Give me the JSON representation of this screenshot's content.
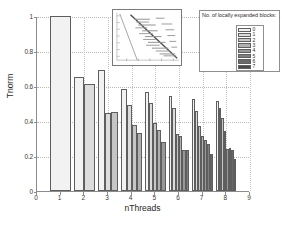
{
  "chart_data": {
    "type": "bar",
    "title": "",
    "xlabel": "nThreads",
    "ylabel": "Tnorm",
    "xlim": [
      0,
      9
    ],
    "ylim": [
      0,
      1
    ],
    "xticks": [
      0,
      1,
      2,
      3,
      4,
      5,
      6,
      7,
      8,
      9
    ],
    "xticklabels": [
      "0",
      "1",
      "2",
      "3",
      "4",
      "5",
      "6",
      "7",
      "8",
      "9"
    ],
    "yticks": [
      0,
      0.2,
      0.4,
      0.6,
      0.8,
      1
    ],
    "yticklabels": [
      "0",
      "0.2",
      "0.4",
      "0.6",
      "0.8",
      "1"
    ],
    "grid": "dotted horizontal and vertical",
    "legend": {
      "title": "No. of locally expanded blocks:",
      "position": "top-right",
      "entries": [
        {
          "label": "0",
          "color": "#f2f2f2"
        },
        {
          "label": "1",
          "color": "#dcdcdc"
        },
        {
          "label": "2",
          "color": "#c6c6c6"
        },
        {
          "label": "3",
          "color": "#b0b0b0"
        },
        {
          "label": "4",
          "color": "#989898"
        },
        {
          "label": "5",
          "color": "#808080"
        },
        {
          "label": "6",
          "color": "#686868"
        },
        {
          "label": "7",
          "color": "#4a4a4a"
        }
      ]
    },
    "categories": [
      "1",
      "2",
      "3",
      "4",
      "5",
      "6",
      "7",
      "8"
    ],
    "series": [
      {
        "name": "0",
        "color": "#f2f2f2",
        "values": [
          1.0,
          0.65,
          0.69,
          0.585,
          0.565,
          0.545,
          0.525,
          0.515
        ]
      },
      {
        "name": "1",
        "color": "#dcdcdc",
        "values": [
          null,
          0.61,
          0.445,
          0.49,
          0.505,
          0.475,
          0.46,
          0.475
        ]
      },
      {
        "name": "2",
        "color": "#c6c6c6",
        "values": [
          null,
          null,
          0.45,
          0.375,
          0.39,
          0.325,
          0.37,
          0.415
        ]
      },
      {
        "name": "3",
        "color": "#b0b0b0",
        "values": [
          null,
          null,
          null,
          0.33,
          0.35,
          0.315,
          0.315,
          0.345
        ]
      },
      {
        "name": "4",
        "color": "#989898",
        "values": [
          null,
          null,
          null,
          null,
          0.28,
          0.235,
          0.29,
          0.24
        ]
      },
      {
        "name": "5",
        "color": "#808080",
        "values": [
          null,
          null,
          null,
          null,
          null,
          0.235,
          0.27,
          0.245
        ]
      },
      {
        "name": "6",
        "color": "#686868",
        "values": [
          null,
          null,
          null,
          null,
          null,
          null,
          0.21,
          0.235
        ]
      },
      {
        "name": "7",
        "color": "#4a4a4a",
        "values": [
          null,
          null,
          null,
          null,
          null,
          null,
          null,
          0.185
        ]
      }
    ],
    "inset": {
      "type": "line",
      "description": "small inset plot with a steep descending line and a diagonal trend line with scattered markers",
      "has_axes": true
    }
  },
  "axes": {
    "ylabel": "Tnorm",
    "xlabel": "nThreads"
  }
}
